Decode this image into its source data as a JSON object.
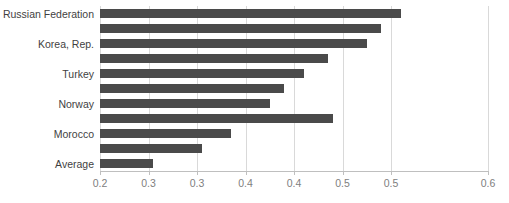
{
  "chart_data": {
    "type": "bar",
    "orientation": "horizontal",
    "title": "",
    "xlabel": "",
    "ylabel": "",
    "xlim": [
      0.2,
      0.6
    ],
    "grid": true,
    "legend": false,
    "bar_color": "#4a4a4a",
    "categories": [
      "Russian Federation",
      "",
      "Korea, Rep.",
      "",
      "Turkey",
      "",
      "Norway",
      "",
      "Morocco",
      "",
      "Average"
    ],
    "values": [
      0.51,
      0.49,
      0.475,
      0.435,
      0.41,
      0.39,
      0.375,
      0.44,
      0.335,
      0.305,
      0.255
    ],
    "xticks": [
      0.2,
      0.25,
      0.3,
      0.35,
      0.4,
      0.45,
      0.5,
      0.55,
      0.6
    ],
    "xticklabels": [
      "0.2",
      "0.3",
      "0.3",
      "0.4",
      "0.4",
      "0.5",
      "0.5",
      "0.6"
    ],
    "xtick_positions": [
      0.2,
      0.25,
      0.3,
      0.35,
      0.4,
      0.45,
      0.5,
      0.6
    ]
  },
  "axis": {
    "tick_labels": [
      "0.2",
      "0.3",
      "0.3",
      "0.4",
      "0.4",
      "0.5",
      "0.5",
      "0.6"
    ]
  },
  "labels": {
    "items": [
      "Russian Federation",
      "Korea, Rep.",
      "Turkey",
      "Norway",
      "Morocco",
      "Average"
    ]
  },
  "title_fragment": ""
}
